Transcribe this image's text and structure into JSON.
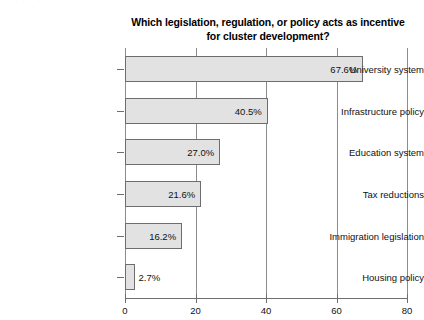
{
  "scan": {
    "artifact_text": "· ·  ·  ·"
  },
  "chart_data": {
    "type": "bar",
    "orientation": "horizontal",
    "title": "Which legislation, regulation, or policy acts as incentive for cluster development?",
    "title_line1": "Which legislation, regulation, or policy acts as incentive",
    "title_line2": "for cluster development?",
    "xlabel": "",
    "ylabel": "",
    "xlim": [
      0,
      80
    ],
    "xticks": [
      0,
      20,
      40,
      60,
      80
    ],
    "xtick_labels": [
      "0",
      "20",
      "40",
      "60",
      "80"
    ],
    "grid": "vertical",
    "legend": "none",
    "categories": [
      "University system",
      "Infrastructure policy",
      "Education system",
      "Tax reductions",
      "Immigration legislation",
      "Housing policy"
    ],
    "values": [
      67.6,
      40.5,
      27.0,
      21.6,
      16.2,
      2.7
    ],
    "value_labels": [
      "67.6%",
      "40.5%",
      "27.0%",
      "21.6%",
      "16.2%",
      "2.7%"
    ],
    "label_placement": [
      "inside",
      "inside",
      "inside",
      "inside",
      "inside",
      "outside"
    ],
    "colors": {
      "bar_fill": "#e2e2e2",
      "bar_border": "#6d6d6d",
      "axis": "#6e6e6e",
      "gridline": "#8c8c8c",
      "text": "#111111",
      "background": "#ffffff"
    }
  }
}
